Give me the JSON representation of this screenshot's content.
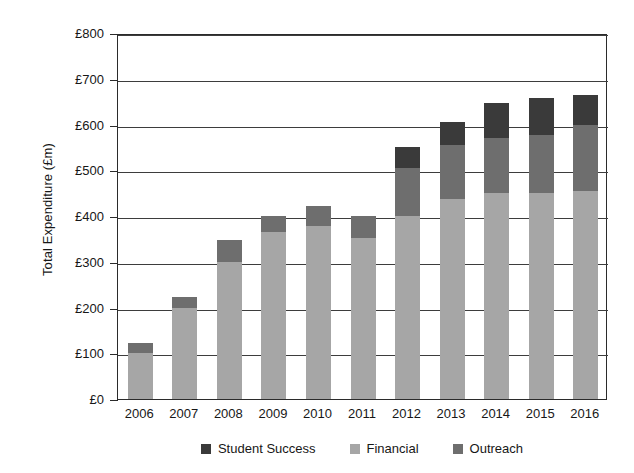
{
  "chart_data": {
    "type": "bar",
    "stacked": true,
    "title": "",
    "xlabel": "",
    "ylabel": "Total Expenditure (£m)",
    "categories": [
      "2006",
      "2007",
      "2008",
      "2009",
      "2010",
      "2011",
      "2012",
      "2013",
      "2014",
      "2015",
      "2016"
    ],
    "series": [
      {
        "name": "Financial",
        "color": "#a6a6a6",
        "values": [
          100,
          200,
          300,
          365,
          378,
          353,
          400,
          437,
          450,
          450,
          455
        ]
      },
      {
        "name": "Outreach",
        "color": "#6e6e6e",
        "values": [
          22,
          22,
          48,
          35,
          44,
          47,
          105,
          119,
          120,
          128,
          143
        ]
      },
      {
        "name": "Student Success",
        "color": "#3a3a3a",
        "values": [
          0,
          0,
          0,
          0,
          0,
          0,
          45,
          49,
          78,
          80,
          67
        ]
      }
    ],
    "totals": [
      122,
      222,
      348,
      400,
      422,
      400,
      550,
      605,
      648,
      658,
      665
    ],
    "ylim": [
      0,
      800
    ],
    "ytick_values": [
      0,
      100,
      200,
      300,
      400,
      500,
      600,
      700,
      800
    ],
    "ytick_labels": [
      "£0",
      "£100",
      "£200",
      "£300",
      "£400",
      "£500",
      "£600",
      "£700",
      "£800"
    ],
    "grid": "horizontal",
    "legend_position": "bottom",
    "legend_order": [
      "Student Success",
      "Financial",
      "Outreach"
    ]
  },
  "legend": {
    "items": [
      {
        "label": "Student Success",
        "color": "#3a3a3a"
      },
      {
        "label": "Financial",
        "color": "#a6a6a6"
      },
      {
        "label": "Outreach",
        "color": "#6e6e6e"
      }
    ]
  }
}
